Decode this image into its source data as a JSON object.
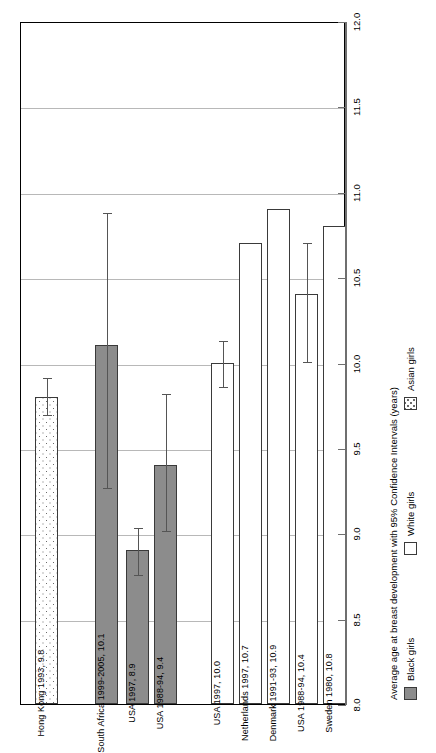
{
  "chart_data": {
    "type": "bar",
    "orientation": "rotated-90",
    "title": "",
    "xlabel": "",
    "ylabel": "Average age at breast development with 95% Confidence Intervals (years)",
    "ylim": [
      8.0,
      12.0
    ],
    "ytick_labels": [
      "8.0",
      "8.5",
      "9.0",
      "9.5",
      "10.0",
      "10.5",
      "11.0",
      "11.5",
      "12.0"
    ],
    "ytick_values": [
      8.0,
      8.5,
      9.0,
      9.5,
      10.0,
      10.5,
      11.0,
      11.5,
      12.0
    ],
    "gridlines": [
      8.5,
      9.0,
      9.5,
      10.0,
      10.5,
      11.0,
      11.5
    ],
    "grid": true,
    "legend_position": "bottom-right",
    "legend": [
      {
        "key": "black",
        "label": "Black girls",
        "color": "#8c8c8c",
        "pattern": "solid-gray"
      },
      {
        "key": "white",
        "label": "White girls",
        "color": "#ffffff",
        "pattern": "open"
      },
      {
        "key": "asian",
        "label": "Asian girls",
        "color": "#ffffff",
        "pattern": "dotted"
      }
    ],
    "categories": [
      "Hong Kong 1993, 9.8",
      "South Africa 1999-2005, 10.1",
      "USA 1997, 8.9",
      "USA 1988-94, 9.4",
      "USA 1997, 10.0",
      "Netherlands 1997, 10.7",
      "Denmark 1991-93, 10.9",
      "USA 1988-94, 10.4",
      "Sweden 1980, 10.8"
    ],
    "bars": [
      {
        "label": "Hong Kong 1993, 9.8",
        "value": 9.8,
        "group": "asian",
        "ci_low": 9.7,
        "ci_high": 9.92,
        "x": 35,
        "width": 23,
        "gap_after": 37
      },
      {
        "label": "South Africa 1999-2005, 10.1",
        "value": 10.1,
        "group": "black",
        "ci_low": 9.27,
        "ci_high": 10.89,
        "x": 95,
        "width": 23,
        "gap_after": 5
      },
      {
        "label": "USA 1997, 8.9",
        "value": 8.9,
        "group": "black",
        "ci_low": 8.76,
        "ci_high": 9.04,
        "x": 126,
        "width": 23,
        "gap_after": 5
      },
      {
        "label": "USA 1988-94, 9.4",
        "value": 9.4,
        "group": "black",
        "ci_low": 9.02,
        "ci_high": 9.83,
        "x": 154,
        "width": 23,
        "gap_after": 34
      },
      {
        "label": "USA 1997, 10.0",
        "value": 10.0,
        "group": "white",
        "ci_low": 9.86,
        "ci_high": 10.14,
        "x": 211,
        "width": 23,
        "gap_after": 5
      },
      {
        "label": "Netherlands 1997, 10.7",
        "value": 10.7,
        "group": "white",
        "ci_low": null,
        "ci_high": null,
        "x": 239,
        "width": 23,
        "gap_after": 5
      },
      {
        "label": "Denmark 1991-93, 10.9",
        "value": 10.9,
        "group": "white",
        "ci_low": null,
        "ci_high": null,
        "x": 267,
        "width": 23,
        "gap_after": 5
      },
      {
        "label": "USA 1988-94, 10.4",
        "value": 10.4,
        "group": "white",
        "ci_low": 10.01,
        "ci_high": 10.71,
        "x": 295,
        "width": 23,
        "gap_after": 5
      },
      {
        "label": "Sweden 1980, 10.8",
        "value": 10.8,
        "group": "white",
        "ci_low": null,
        "ci_high": null,
        "x": 323,
        "width": 0,
        "gap_after": 0
      }
    ]
  },
  "axis": {
    "title": "Average age at breast development with 95% Confidence Intervals (years)"
  },
  "legend": {
    "black_label": "Black girls",
    "white_label": "White girls",
    "asian_label": "Asian girls"
  }
}
